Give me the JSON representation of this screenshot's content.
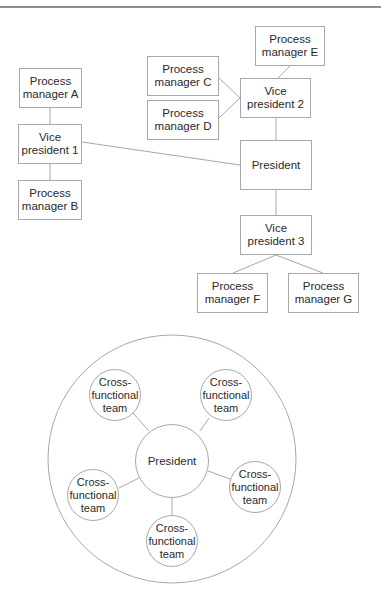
{
  "hierarchy_chart": {
    "nodes": {
      "pm_a": "Process\nmanager A",
      "vp1": "Vice\npresident 1",
      "pm_b": "Process\nmanager B",
      "pm_c": "Process\nmanager C",
      "pm_d": "Process\nmanager D",
      "pm_e": "Process\nmanager E",
      "vp2": "Vice\npresident 2",
      "president": "President",
      "vp3": "Vice\npresident 3",
      "pm_f": "Process\nmanager F",
      "pm_g": "Process\nmanager G"
    },
    "edges": [
      [
        "pm_a",
        "vp1"
      ],
      [
        "vp1",
        "pm_b"
      ],
      [
        "vp1",
        "president"
      ],
      [
        "pm_c",
        "vp2"
      ],
      [
        "pm_d",
        "vp2"
      ],
      [
        "pm_e",
        "vp2"
      ],
      [
        "vp2",
        "president"
      ],
      [
        "president",
        "vp3"
      ],
      [
        "vp3",
        "pm_f"
      ],
      [
        "vp3",
        "pm_g"
      ]
    ]
  },
  "circular_chart": {
    "center": "President",
    "teams": [
      "Cross-\nfunctional\nteam",
      "Cross-\nfunctional\nteam",
      "Cross-\nfunctional\nteam",
      "Cross-\nfunctional\nteam",
      "Cross-\nfunctional\nteam"
    ]
  },
  "colors": {
    "line": "#a8a8a8",
    "text": "#2a2a2a",
    "rule": "#8c8c8c"
  }
}
